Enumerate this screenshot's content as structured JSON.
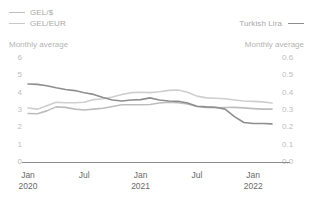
{
  "legend": {
    "left": [
      {
        "label": "GEL/$",
        "color": "#bdbdbd",
        "icon": "line-swatch-icon"
      },
      {
        "label": "GEL/EUR",
        "color": "#cccccc",
        "icon": "line-swatch-icon"
      }
    ],
    "right": [
      {
        "label": "Turkish Lira",
        "color": "#8e8e8e",
        "icon": "line-swatch-icon"
      }
    ]
  },
  "subtitles": {
    "left": "Monthly average",
    "right": "Monthly average"
  },
  "chart_data": {
    "type": "line",
    "title": "",
    "subtitle": "Monthly average",
    "xlabel": "",
    "ylabel": "",
    "grid": false,
    "legend_position": "top",
    "x": [
      "Jan 2020",
      "Feb 2020",
      "Mar 2020",
      "Apr 2020",
      "May 2020",
      "Jun 2020",
      "Jul 2020",
      "Aug 2020",
      "Sep 2020",
      "Oct 2020",
      "Nov 2020",
      "Dec 2020",
      "Jan 2021",
      "Feb 2021",
      "Mar 2021",
      "Apr 2021",
      "May 2021",
      "Jun 2021",
      "Jul 2021",
      "Aug 2021",
      "Sep 2021",
      "Oct 2021",
      "Nov 2021",
      "Dec 2021",
      "Jan 2022",
      "Feb 2022",
      "Mar 2022"
    ],
    "x_tick_labels": [
      {
        "month": "Jan",
        "year": "2020"
      },
      {
        "month": "Jul",
        "year": ""
      },
      {
        "month": "Jan",
        "year": "2021"
      },
      {
        "month": "Jul",
        "year": ""
      },
      {
        "month": "Jan",
        "year": "2022"
      }
    ],
    "axes": {
      "left": {
        "ticks": [
          "6",
          "5",
          "4",
          "3",
          "2",
          "1",
          "0"
        ],
        "min": 0,
        "max": 6
      },
      "right": {
        "ticks": [
          "0.6",
          "0.5",
          "0.4",
          "0.3",
          "0.2",
          "0.1",
          "0.0"
        ],
        "min": 0.0,
        "max": 0.6
      }
    },
    "series": [
      {
        "name": "GEL/$",
        "axis": "left",
        "color": "#bdbdbd",
        "values": [
          2.8,
          2.78,
          2.95,
          3.18,
          3.15,
          3.05,
          3.0,
          3.05,
          3.1,
          3.2,
          3.3,
          3.3,
          3.3,
          3.32,
          3.4,
          3.45,
          3.42,
          3.35,
          3.2,
          3.15,
          3.13,
          3.14,
          3.15,
          3.12,
          3.08,
          3.05,
          3.05
        ]
      },
      {
        "name": "GEL/EUR",
        "axis": "left",
        "color": "#cfcfcf",
        "values": [
          3.12,
          3.05,
          3.25,
          3.45,
          3.42,
          3.42,
          3.45,
          3.6,
          3.65,
          3.75,
          3.9,
          4.0,
          4.02,
          4.0,
          4.05,
          4.13,
          4.15,
          4.02,
          3.8,
          3.7,
          3.68,
          3.65,
          3.58,
          3.52,
          3.5,
          3.47,
          3.4
        ]
      },
      {
        "name": "Turkish Lira",
        "axis": "right",
        "color": "#8e8e8e",
        "values": [
          0.45,
          0.448,
          0.44,
          0.428,
          0.418,
          0.412,
          0.4,
          0.39,
          0.372,
          0.358,
          0.352,
          0.358,
          0.36,
          0.37,
          0.358,
          0.352,
          0.35,
          0.34,
          0.322,
          0.318,
          0.316,
          0.305,
          0.262,
          0.228,
          0.222,
          0.222,
          0.22
        ]
      }
    ]
  }
}
